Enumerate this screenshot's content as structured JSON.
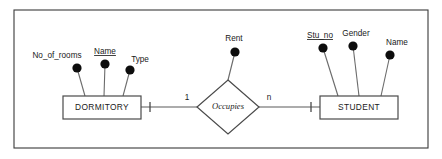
{
  "diagram": {
    "type": "er-diagram",
    "title": "",
    "background_color": "#ffffff",
    "frame": {
      "stroke_color": "#3a3a3a",
      "x": 14,
      "y": 10,
      "width": 414,
      "height": 138
    },
    "palette": {
      "entity_stroke": "#4a4a4a",
      "relationship_stroke": "#4a4a4a",
      "attribute_fill": "#0d0d0d",
      "connector_stroke": "#6b6b6b",
      "text_color": "#1a1a1a"
    },
    "entities": [
      {
        "id": "dormitory",
        "label": "DORMITORY",
        "x": 63,
        "y": 96,
        "width": 78,
        "height": 23,
        "attributes": [
          {
            "label": "No_of_rooms",
            "is_key": false,
            "dot_x": 77,
            "dot_y": 68,
            "label_x": 57,
            "label_y": 58,
            "anchor_x": 85
          },
          {
            "label": "Name",
            "is_key": true,
            "dot_x": 105,
            "dot_y": 64,
            "label_x": 105,
            "label_y": 54,
            "anchor_x": 104
          },
          {
            "label": "Type",
            "is_key": false,
            "dot_x": 130,
            "dot_y": 70,
            "label_x": 140,
            "label_y": 62,
            "anchor_x": 123
          }
        ]
      },
      {
        "id": "student",
        "label": "STUDENT",
        "x": 320,
        "y": 96,
        "width": 78,
        "height": 23,
        "attributes": [
          {
            "label": "Stu_no",
            "is_key": true,
            "dot_x": 323,
            "dot_y": 48,
            "label_x": 320,
            "label_y": 38,
            "anchor_x": 338
          },
          {
            "label": "Gender",
            "is_key": false,
            "dot_x": 353,
            "dot_y": 46,
            "label_x": 356,
            "label_y": 36,
            "anchor_x": 359
          },
          {
            "label": "Name",
            "is_key": false,
            "dot_x": 390,
            "dot_y": 55,
            "label_x": 397,
            "label_y": 45,
            "anchor_x": 381
          }
        ]
      }
    ],
    "relationships": [
      {
        "id": "occupies",
        "label": "Occupies",
        "center_x": 228,
        "center_y": 107,
        "half_width": 31,
        "half_height": 27,
        "attributes": [
          {
            "label": "Rent",
            "is_key": false,
            "dot_x": 235,
            "dot_y": 52,
            "label_x": 234,
            "label_y": 41
          }
        ],
        "left_entity": "dormitory",
        "right_entity": "student",
        "left_cardinality": "1",
        "right_cardinality": "n",
        "left_card_x": 187,
        "left_card_y": 100,
        "right_card_x": 269,
        "right_card_y": 100
      }
    ],
    "connectors": [
      {
        "from": "dormitory-right",
        "to": "occupies-left",
        "x1": 141,
        "y1": 107,
        "x2": 197,
        "y2": 107,
        "tick_x": 150
      },
      {
        "from": "occupies-right",
        "to": "student-left",
        "x1": 259,
        "y1": 107,
        "x2": 320,
        "y2": 107,
        "tick_x": 311
      }
    ]
  }
}
